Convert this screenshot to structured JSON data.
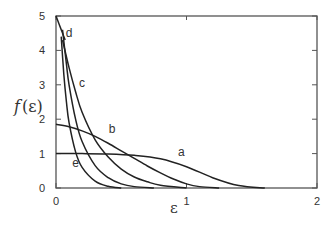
{
  "chart_data": {
    "type": "line",
    "title": "",
    "xlabel": "ε",
    "ylabel": "f(ε)",
    "xlim": [
      0,
      2
    ],
    "ylim": [
      0,
      5
    ],
    "xticks": [
      0,
      1,
      2
    ],
    "yticks": [
      0,
      1,
      2,
      3,
      4,
      5
    ],
    "grid": false,
    "legend": "none (curves labeled inline)",
    "series": [
      {
        "name": "a",
        "x": [
          0,
          0.2,
          0.4,
          0.6,
          0.8,
          1.0,
          1.2,
          1.4,
          1.6
        ],
        "y": [
          1.0,
          1.0,
          0.99,
          0.95,
          0.85,
          0.62,
          0.3,
          0.07,
          0.0
        ]
      },
      {
        "name": "b",
        "x": [
          0,
          0.1,
          0.2,
          0.3,
          0.4,
          0.5,
          0.6,
          0.7,
          0.8,
          0.9,
          1.0,
          1.1,
          1.25
        ],
        "y": [
          1.85,
          1.78,
          1.66,
          1.5,
          1.3,
          1.08,
          0.86,
          0.64,
          0.44,
          0.26,
          0.12,
          0.04,
          0.0
        ]
      },
      {
        "name": "c",
        "x": [
          0.05,
          0.1,
          0.15,
          0.2,
          0.3,
          0.4,
          0.5,
          0.6,
          0.7,
          0.8,
          1.0
        ],
        "y": [
          4.3,
          3.5,
          2.8,
          2.2,
          1.4,
          0.9,
          0.55,
          0.32,
          0.18,
          0.08,
          0.0
        ]
      },
      {
        "name": "d",
        "x": [
          0.05,
          0.08,
          0.1,
          0.15,
          0.2,
          0.3,
          0.4,
          0.5,
          0.6,
          0.75
        ],
        "y": [
          4.6,
          3.6,
          3.0,
          2.0,
          1.35,
          0.65,
          0.3,
          0.12,
          0.04,
          0.0
        ]
      },
      {
        "name": "e",
        "x": [
          0.04,
          0.06,
          0.08,
          0.1,
          0.15,
          0.2,
          0.3,
          0.4,
          0.5
        ],
        "y": [
          4.4,
          3.3,
          2.5,
          1.9,
          1.05,
          0.6,
          0.2,
          0.05,
          0.0
        ]
      },
      {
        "name": "initial",
        "x": [
          0,
          0.07
        ],
        "y": [
          5.0,
          4.3
        ]
      }
    ],
    "annotations": [
      {
        "text": "a",
        "x": 0.96,
        "y": 0.92
      },
      {
        "text": "b",
        "x": 0.43,
        "y": 1.6
      },
      {
        "text": "c",
        "x": 0.2,
        "y": 2.95
      },
      {
        "text": "d",
        "x": 0.1,
        "y": 4.4
      },
      {
        "text": "e",
        "x": 0.15,
        "y": 0.62
      }
    ]
  },
  "axis": {
    "y_tick_labels": [
      "0",
      "1",
      "2",
      "3",
      "4",
      "5"
    ],
    "x_tick_labels": [
      "0",
      "1",
      "2"
    ],
    "ylabel_f": "f",
    "ylabel_arg": "(ε)",
    "xlabel": "ε"
  }
}
